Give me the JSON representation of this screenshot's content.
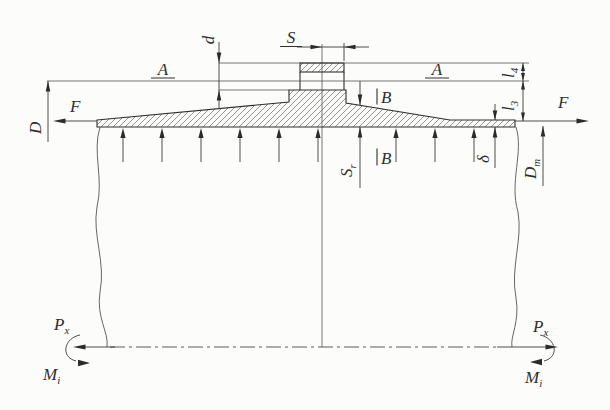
{
  "colors": {
    "ink": "#2f2f2f",
    "paper": "#fcfcfa"
  },
  "labels": {
    "s_dim": {
      "text": "S",
      "underline": true
    },
    "d_dim": {
      "text": "d"
    },
    "a_left": {
      "text": "A",
      "underline": true
    },
    "a_right": {
      "text": "A",
      "underline": true
    },
    "b_top": {
      "text": "B"
    },
    "b_bottom": {
      "text": "B"
    },
    "s_r": {
      "text": "S",
      "sub": "r"
    },
    "l4": {
      "text": "l",
      "sub": "4"
    },
    "l3": {
      "text": "l",
      "sub": "3"
    },
    "delta": {
      "text": "δ"
    },
    "d_mean": {
      "text": "D",
      "sub": "m"
    },
    "d_outer": {
      "text": "D"
    },
    "f_left": {
      "text": "F"
    },
    "f_right": {
      "text": "F"
    },
    "p_left": {
      "text": "P",
      "sub": "x"
    },
    "p_right": {
      "text": "P",
      "sub": "x"
    },
    "m_left": {
      "text": "M",
      "sub": "i"
    },
    "m_right": {
      "text": "M",
      "sub": "i"
    }
  }
}
